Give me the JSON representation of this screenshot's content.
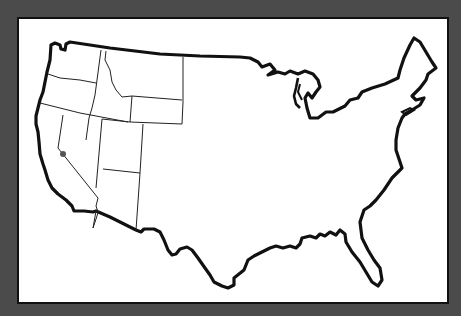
{
  "map": {
    "subject": "Contiguous United States outline",
    "style": "black outline on white panel, dark gray border",
    "states_outlined": [
      "Washington",
      "Oregon",
      "California",
      "Idaho",
      "Nevada",
      "Montana",
      "Wyoming",
      "Utah",
      "Arizona"
    ],
    "marker": {
      "location": "Central California",
      "shape": "dot",
      "color": "#555555"
    },
    "colors": {
      "background": "#4b4b4b",
      "panel": "#ffffff",
      "outline": "#111111"
    }
  }
}
